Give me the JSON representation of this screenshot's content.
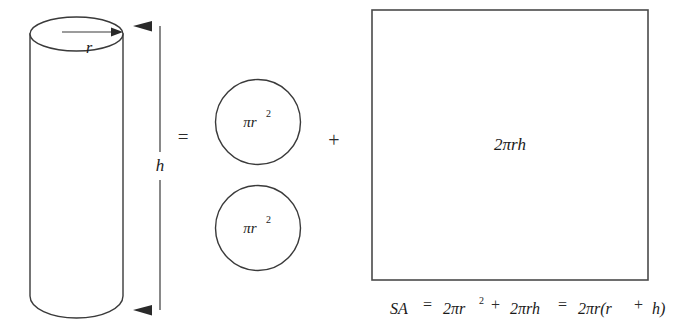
{
  "figure": {
    "background_color": "#ffffff",
    "ink_color": "#3a3a3a",
    "shapes": {
      "cylinder": {
        "name": "cylinder",
        "radius_label": "r",
        "height_label": "h"
      },
      "circle_top": {
        "name": "top-circle",
        "label": "πr"
      },
      "circle_bottom": {
        "name": "bottom-circle",
        "label": "πr"
      },
      "rectangle": {
        "name": "lateral-rectangle",
        "label": "2πrh"
      }
    },
    "operators": {
      "equals": "=",
      "plus": "+",
      "exponent_two": "2"
    },
    "formula": {
      "lhs": "SA",
      "equals_1": "=",
      "term_1": "2πr",
      "term_1_exponent": "2",
      "plus": "+",
      "term_2": "2πrh",
      "equals_2": "=",
      "term_3": "2πr(r",
      "term_3_plus": "+",
      "term_3_tail": "h)",
      "full_text": "SA = 2πr² + 2πrh = 2πr(r + h)"
    }
  }
}
